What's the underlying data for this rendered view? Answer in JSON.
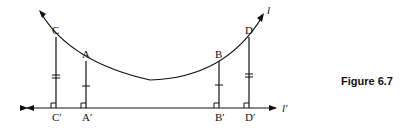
{
  "figure": {
    "caption": "Figure 6.7",
    "curve_label": "l",
    "line_label": "l′",
    "points": {
      "C": "C",
      "A": "A",
      "B": "B",
      "D": "D",
      "C_prime": "C′",
      "A_prime": "A′",
      "B_prime": "B′",
      "D_prime": "D′"
    },
    "tick_marks": {
      "CC_prime": 2,
      "AA_prime": 1,
      "BB_prime": 1,
      "DD_prime": 2
    },
    "right_angles": [
      "C′",
      "A′",
      "B′",
      "D′"
    ],
    "colors": {
      "stroke": "#111111",
      "background": "#ffffff"
    }
  }
}
